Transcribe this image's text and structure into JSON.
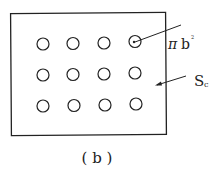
{
  "diagram": {
    "caption": "( b )",
    "labels": {
      "pi": "π",
      "b": "b",
      "exp": "2",
      "S": "S",
      "sub": "c"
    },
    "grid": {
      "rows": 3,
      "cols": 4
    },
    "colors": {
      "stroke": "#222222",
      "background": "#ffffff"
    }
  }
}
